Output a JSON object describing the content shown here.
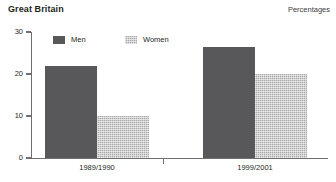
{
  "header": {
    "title": "Great Britain",
    "units": "Percentages"
  },
  "legend": {
    "items": [
      {
        "label": "Men",
        "swatch": "men-swatch",
        "color": "#58585a"
      },
      {
        "label": "Women",
        "swatch": "women-swatch",
        "color": "#a9a9ab"
      }
    ]
  },
  "axes": {
    "y_ticks": [
      "0",
      "10",
      "20",
      "30"
    ]
  },
  "chart_data": {
    "type": "bar",
    "title": "Great Britain",
    "subtitle": "Percentages",
    "categories": [
      "1989/1990",
      "1999/2001"
    ],
    "series": [
      {
        "name": "Men",
        "values": [
          22,
          26.5
        ],
        "color": "#58585a"
      },
      {
        "name": "Women",
        "values": [
          10,
          20
        ],
        "color": "#a9a9ab"
      }
    ],
    "xlabel": "",
    "ylabel": "",
    "ylim": [
      0,
      30
    ],
    "yticks": [
      0,
      10,
      20,
      30
    ],
    "grid": false,
    "legend_position": "top-left"
  }
}
